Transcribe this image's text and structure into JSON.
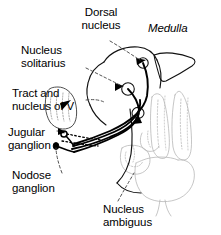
{
  "figure": {
    "background_color": "#ffffff",
    "line_color": "#000000",
    "faint_structure_color": "#b9b9b9",
    "width": 221,
    "height": 235
  },
  "labels": {
    "dorsal_nucleus": "Dorsal\nnucleus",
    "medulla": "Medulla",
    "nucleus_solitarius": "Nucleus\nsolitarius",
    "tract_and_nucleus_of_v": "Tract and\nnucleus of V",
    "jugular_ganglion": "Jugular\nganglion",
    "nodose_ganglion": "Nodose\nganglion",
    "nucleus_ambiguus": "Nucleus\nambiguus"
  },
  "structures": [
    {
      "name": "dorsal-nucleus",
      "kind": "nucleus",
      "shape": "small-circle"
    },
    {
      "name": "nucleus-solitarius",
      "kind": "nucleus",
      "shape": "small-circle"
    },
    {
      "name": "nucleus-ambiguus",
      "kind": "nucleus",
      "shape": "small-oval"
    },
    {
      "name": "tract-and-nucleus-of-v",
      "kind": "tract",
      "shape": "elongated-oval"
    },
    {
      "name": "jugular-ganglion",
      "kind": "ganglion",
      "shape": "small-open-circle"
    },
    {
      "name": "nodose-ganglion",
      "kind": "ganglion",
      "shape": "filled-oval"
    },
    {
      "name": "vagus-nerve-fibers",
      "kind": "nerve-bundle",
      "shape": "parallel-curved-lines"
    },
    {
      "name": "medulla-outline",
      "kind": "brainstem",
      "shape": "rounded-mass"
    },
    {
      "name": "posterior-columns",
      "kind": "spinal-cord",
      "shape": "paired-columns"
    }
  ]
}
